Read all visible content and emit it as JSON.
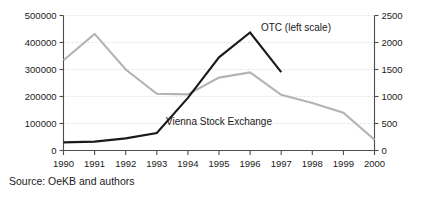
{
  "source_caption": "Source: OeKB and authors",
  "annotations": {
    "otc_label": "OTC (left scale)",
    "vse_label": "Vienna Stock Exchange"
  },
  "colors": {
    "otc_line": "#1a1a1a",
    "vse_line": "#b3b3b3",
    "axis": "#4d4d4d",
    "gridline": "#d9d9d9",
    "background": "#ffffff"
  },
  "chart_data": {
    "type": "line",
    "title": "",
    "subtitle": "",
    "xlabel": "",
    "ylabel": "",
    "grid": true,
    "legend_position": "inline-annotation",
    "categories": [
      "1990",
      "1991",
      "1992",
      "1993",
      "1994",
      "1995",
      "1996",
      "1997",
      "1998",
      "1999",
      "2000"
    ],
    "x": [
      1990,
      1991,
      1992,
      1993,
      1994,
      1995,
      1996,
      1997,
      1998,
      1999,
      2000
    ],
    "axes": {
      "left": {
        "label": "",
        "ylim": [
          0,
          500000
        ],
        "ticks": [
          0,
          100000,
          200000,
          300000,
          400000,
          500000
        ],
        "ticklabels": [
          "0",
          "100000",
          "200000",
          "300000",
          "400000",
          "500000"
        ]
      },
      "right": {
        "label": "",
        "ylim": [
          0,
          2500
        ],
        "ticks": [
          0,
          500,
          1000,
          1500,
          2000,
          2500
        ],
        "ticklabels": [
          "0",
          "500",
          "1000",
          "1500",
          "2000",
          "2500"
        ]
      },
      "x": {
        "xlim": [
          1990,
          2000
        ],
        "ticks": [
          1990,
          1991,
          1992,
          1993,
          1994,
          1995,
          1996,
          1997,
          1998,
          1999,
          2000
        ],
        "ticklabels": [
          "1990",
          "1991",
          "1992",
          "1993",
          "1994",
          "1995",
          "1996",
          "1997",
          "1998",
          "1999",
          "2000"
        ]
      }
    },
    "series": [
      {
        "name": "OTC (left scale)",
        "axis": "left",
        "color": "#1a1a1a",
        "x": [
          1990,
          1991,
          1992,
          1993,
          1994,
          1995,
          1996,
          1997
        ],
        "values": [
          30000,
          33000,
          45000,
          65000,
          195000,
          345000,
          437000,
          290000
        ]
      },
      {
        "name": "Vienna Stock Exchange",
        "axis": "right",
        "color": "#b3b3b3",
        "x": [
          1990,
          1991,
          1992,
          1993,
          1994,
          1995,
          1996,
          1997,
          1998,
          1999,
          2000
        ],
        "values": [
          1670,
          2160,
          1500,
          1050,
          1040,
          1350,
          1445,
          1030,
          880,
          700,
          200
        ]
      }
    ]
  }
}
